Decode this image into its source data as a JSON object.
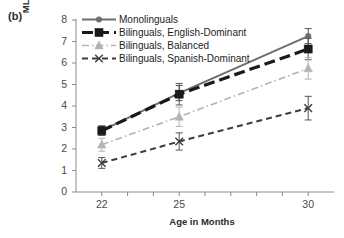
{
  "panel": {
    "label": "(b)"
  },
  "chart_data": {
    "type": "line",
    "title": "",
    "xlabel": "Age in Months",
    "ylabel": "MLU of Longest English Utterances",
    "x": [
      22,
      25,
      30
    ],
    "xticklabels": [
      "22",
      "25",
      "30"
    ],
    "yticklabels": [
      "0",
      "1",
      "2",
      "3",
      "4",
      "5",
      "6",
      "7",
      "8"
    ],
    "xlim": [
      21,
      31
    ],
    "ylim": [
      0,
      8
    ],
    "grid": false,
    "legend_position": "upper-left",
    "series": [
      {
        "name": "Monolinguals",
        "values": [
          2.85,
          4.6,
          7.25
        ],
        "errors": [
          0.22,
          0.35,
          0.35
        ],
        "color": "#6e6e6e",
        "style": "solid",
        "marker": "circle"
      },
      {
        "name": "Bilinguals, English-Dominant",
        "values": [
          2.85,
          4.55,
          6.65
        ],
        "errors": [
          0.22,
          0.5,
          0.5
        ],
        "color": "#1a1a1a",
        "style": "long-dash",
        "marker": "square"
      },
      {
        "name": "Bilinguals, Balanced",
        "values": [
          2.2,
          3.5,
          5.75
        ],
        "errors": [
          0.3,
          0.45,
          0.5
        ],
        "color": "#b3b3b3",
        "style": "dash-dot",
        "marker": "triangle"
      },
      {
        "name": "Bilinguals, Spanish-Dominant",
        "values": [
          1.35,
          2.35,
          3.9
        ],
        "errors": [
          0.25,
          0.4,
          0.55
        ],
        "color": "#3d3d3d",
        "style": "dash",
        "marker": "cross"
      }
    ]
  }
}
